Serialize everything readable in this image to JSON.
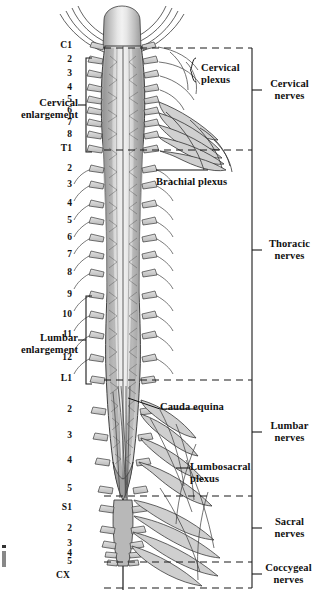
{
  "figure": {
    "background_color": "#ffffff",
    "ink_color": "#111111",
    "cord_fill": "#b5b5b5",
    "cord_fill_light": "#d8d8d8",
    "nerve_fill": "#c9c9c9"
  },
  "segment_labels": {
    "cervical": [
      "C1",
      "2",
      "3",
      "4",
      "5",
      "6",
      "7",
      "8"
    ],
    "thoracic": [
      "T1",
      "2",
      "3",
      "4",
      "5",
      "6",
      "7",
      "8",
      "9",
      "10",
      "11",
      "12"
    ],
    "lumbar": [
      "L1",
      "2",
      "3",
      "4",
      "5"
    ],
    "sacral": [
      "S1",
      "2",
      "3",
      "4",
      "5"
    ],
    "coccygeal": [
      "CX"
    ]
  },
  "segments": [
    {
      "label": "C1",
      "y": 47
    },
    {
      "label": "2",
      "y": 61
    },
    {
      "label": "3",
      "y": 75
    },
    {
      "label": "4",
      "y": 89
    },
    {
      "label": "5",
      "y": 101
    },
    {
      "label": "6",
      "y": 112
    },
    {
      "label": "7",
      "y": 124
    },
    {
      "label": "8",
      "y": 136
    },
    {
      "label": "T1",
      "y": 150
    },
    {
      "label": "2",
      "y": 170
    },
    {
      "label": "3",
      "y": 186
    },
    {
      "label": "4",
      "y": 205
    },
    {
      "label": "5",
      "y": 222
    },
    {
      "label": "6",
      "y": 239
    },
    {
      "label": "7",
      "y": 256
    },
    {
      "label": "8",
      "y": 274
    },
    {
      "label": "9",
      "y": 296
    },
    {
      "label": "10",
      "y": 316
    },
    {
      "label": "11",
      "y": 336
    },
    {
      "label": "12",
      "y": 359
    },
    {
      "label": "L1",
      "y": 380
    },
    {
      "label": "2",
      "y": 411
    },
    {
      "label": "3",
      "y": 437
    },
    {
      "label": "4",
      "y": 462
    },
    {
      "label": "5",
      "y": 490
    },
    {
      "label": "S1",
      "y": 509
    },
    {
      "label": "2",
      "y": 530
    },
    {
      "label": "3",
      "y": 545
    },
    {
      "label": "4",
      "y": 555
    },
    {
      "label": "5",
      "y": 563
    },
    {
      "label": "CX",
      "y": 577
    }
  ],
  "enlargements": [
    {
      "name": "cervical-enlargement",
      "line1": "Cervical",
      "line2": "enlargement",
      "bracket_top": 58,
      "bracket_bottom": 152,
      "label_y": 98
    },
    {
      "name": "lumbar-enlargement",
      "line1": "Lumbar",
      "line2": "enlargement",
      "bracket_top": 296,
      "bracket_bottom": 384,
      "label_y": 330
    }
  ],
  "plexus_labels": [
    {
      "name": "cervical-plexus",
      "line1": "Cervical",
      "line2": "plexus",
      "x": 203,
      "y": 68
    },
    {
      "name": "brachial-plexus",
      "line1": "Brachial plexus",
      "line2": "",
      "x": 158,
      "y": 178
    },
    {
      "name": "cauda-equina",
      "line1": "Cauda equina",
      "line2": "",
      "x": 162,
      "y": 406
    },
    {
      "name": "lumbosacral-plexus",
      "line1": "Lumbosacral",
      "line2": "plexus",
      "x": 192,
      "y": 466
    }
  ],
  "nerve_groups": [
    {
      "name": "cervical-nerves",
      "line1": "Cervical",
      "line2": "nerves",
      "top": 48,
      "bottom": 150,
      "tick_y": 90,
      "label_y": 83
    },
    {
      "name": "thoracic-nerves",
      "line1": "Thoracic",
      "line2": "nerves",
      "top": 150,
      "bottom": 380,
      "tick_y": 250,
      "label_y": 243
    },
    {
      "name": "lumbar-nerves",
      "line1": "Lumbar",
      "line2": "nerves",
      "top": 380,
      "bottom": 496,
      "tick_y": 432,
      "label_y": 425
    },
    {
      "name": "sacral-nerves",
      "line1": "Sacral",
      "line2": "nerves",
      "top": 496,
      "bottom": 562,
      "tick_y": 528,
      "label_y": 521
    },
    {
      "name": "coccygeal-nerves",
      "line1": "Coccygeal",
      "line2": "nerves",
      "top": 562,
      "bottom": 588,
      "tick_y": 574,
      "label_y": 566
    }
  ],
  "divider_lines_y": [
    48,
    150,
    380,
    496,
    562,
    588
  ],
  "geometry": {
    "cord_center_x": 122,
    "segment_label_x": 72,
    "group_axis_x": 252,
    "group_label_x": 264,
    "enlargement_bracket_x": 86,
    "enlargement_label_x": 78,
    "divider_x_start": 104,
    "divider_x_end": 252
  }
}
